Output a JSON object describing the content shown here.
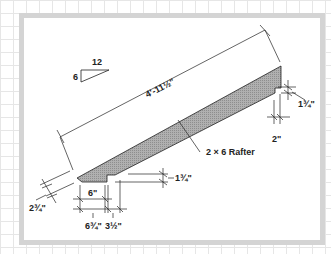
{
  "drawing": {
    "title": "2 × 6 Rafter",
    "pitch": {
      "rise": "6",
      "run": "12"
    },
    "dimensions": {
      "overall_length": "4'-11½\"",
      "ridge_plumb_cut": "1¾\"",
      "ridge_seat": "2\"",
      "tail_plumb": "2¾\"",
      "birdsmouth_heel": "1¾\"",
      "seat_cut": "6\"",
      "tail_offset": "6¾\"",
      "wall_plate": "3½\""
    },
    "member_label": "2 × 6 Rafter",
    "colors": {
      "member_fill": "#a8a8a8",
      "line": "#222222",
      "frame": "#d4d4d4",
      "grid": "#e6e6e6"
    }
  }
}
